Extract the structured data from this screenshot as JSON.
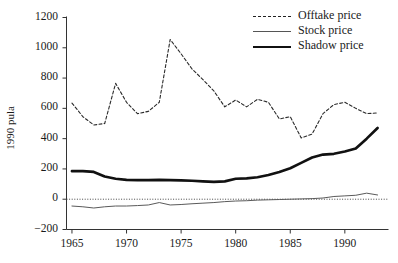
{
  "chart_data": {
    "type": "line",
    "title": "",
    "xlabel": "",
    "ylabel": "1990 pula",
    "xlim": [
      1964.5,
      1994.0
    ],
    "ylim": [
      -200,
      1200
    ],
    "xticks": [
      1965,
      1970,
      1975,
      1980,
      1985,
      1990
    ],
    "yticks": [
      -200,
      0,
      200,
      400,
      600,
      800,
      1000,
      1200
    ],
    "xtick_labels": [
      "1965",
      "1970",
      "1975",
      "1980",
      "1985",
      "1990"
    ],
    "ytick_labels": [
      "-200",
      "0",
      "200",
      "400",
      "600",
      "800",
      "1000",
      "1200"
    ],
    "grid": false,
    "legend_position": "top-right",
    "zero_reference_line": 0,
    "x": [
      1965,
      1966,
      1967,
      1968,
      1969,
      1970,
      1971,
      1972,
      1973,
      1974,
      1975,
      1976,
      1977,
      1978,
      1979,
      1980,
      1981,
      1982,
      1983,
      1984,
      1985,
      1986,
      1987,
      1988,
      1989,
      1990,
      1991,
      1992,
      1993
    ],
    "series": [
      {
        "name": "Offtake price",
        "style": "dashed",
        "values": [
          635,
          545,
          490,
          500,
          765,
          640,
          565,
          580,
          640,
          1055,
          960,
          860,
          790,
          715,
          610,
          655,
          610,
          660,
          640,
          530,
          545,
          405,
          430,
          565,
          625,
          640,
          600,
          565,
          570
        ]
      },
      {
        "name": "Stock price",
        "style": "thin-solid",
        "values": [
          -45,
          -50,
          -58,
          -50,
          -45,
          -45,
          -42,
          -38,
          -22,
          -38,
          -35,
          -30,
          -26,
          -22,
          -16,
          -12,
          -10,
          -6,
          -4,
          -2,
          0,
          2,
          4,
          8,
          18,
          22,
          26,
          40,
          28
        ]
      },
      {
        "name": "Shadow price",
        "style": "thick-solid",
        "values": [
          185,
          186,
          180,
          150,
          135,
          128,
          126,
          126,
          128,
          126,
          124,
          122,
          118,
          114,
          118,
          135,
          138,
          145,
          160,
          180,
          205,
          240,
          275,
          295,
          300,
          315,
          335,
          400,
          470
        ]
      }
    ]
  },
  "legend": {
    "items": [
      {
        "label": "Offtake price",
        "key": "dashed"
      },
      {
        "label": "Stock price",
        "key": "thin-solid"
      },
      {
        "label": "Shadow price",
        "key": "thick-solid"
      }
    ]
  },
  "colors": {
    "axis": "#333333",
    "offtake": "#2a2a2a",
    "stock": "#5a5a5a",
    "shadow": "#111111",
    "background": "#ffffff"
  }
}
